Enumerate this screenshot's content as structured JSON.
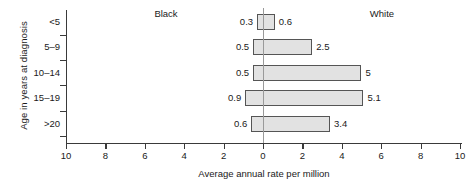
{
  "chart_data": {
    "type": "bar",
    "orientation": "horizontal",
    "style": "back-to-back population pyramid",
    "title": "",
    "xlabel": "Average annual rate per million",
    "ylabel": "Age in years at diagnosis",
    "categories": [
      "<5",
      "5–9",
      "10–14",
      "15–19",
      ">20"
    ],
    "series": [
      {
        "name": "Black",
        "side": "left",
        "values": [
          0.3,
          0.5,
          0.5,
          0.9,
          0.6
        ]
      },
      {
        "name": "White",
        "side": "right",
        "values": [
          0.6,
          2.5,
          5,
          5.1,
          3.4
        ]
      }
    ],
    "value_labels": {
      "left": [
        "0.3",
        "0.5",
        "0.5",
        "0.9",
        "0.6"
      ],
      "right": [
        "0.6",
        "2.5",
        "5",
        "5.1",
        "3.4"
      ]
    },
    "xlim": [
      -10,
      10
    ],
    "xticks": [
      -10,
      -8,
      -6,
      -4,
      -2,
      0,
      2,
      4,
      6,
      8,
      10
    ],
    "xtick_labels": [
      "10",
      "8",
      "6",
      "4",
      "2",
      "0",
      "2",
      "4",
      "6",
      "8",
      "10"
    ],
    "grid": false,
    "legend_position": "inline-top-headings",
    "bar_fill_color": "#e2e2e2",
    "bar_border_color": "#555555",
    "axis_color": "#3a3a3a",
    "zero_line_color": "#9a9a9a"
  }
}
